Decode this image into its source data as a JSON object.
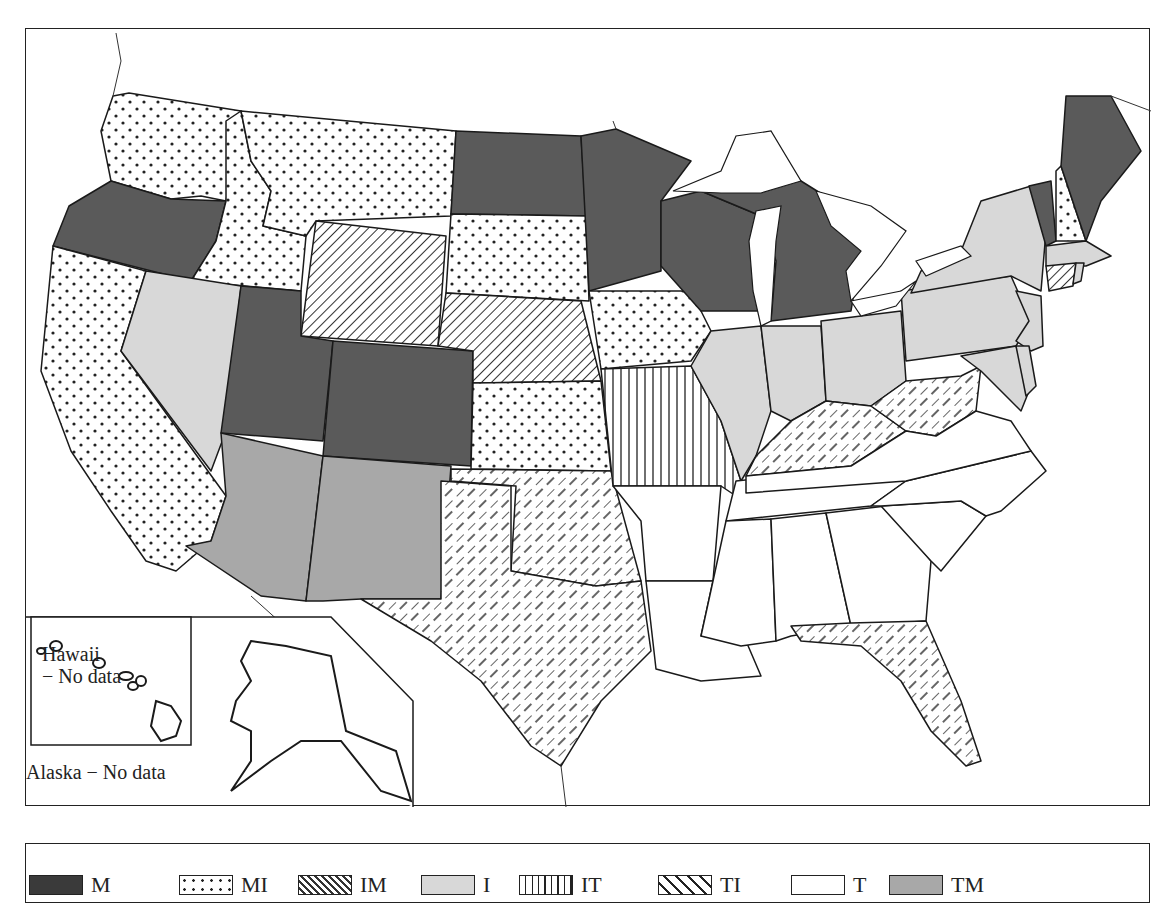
{
  "map": {
    "title": "",
    "insets": {
      "hawaii_label_line1": "Hawaii",
      "hawaii_label_line2": "− No data",
      "alaska_label": "Alaska − No data"
    },
    "categories": {
      "M": {
        "pattern": "solid-dark",
        "color": "#5a5a5a"
      },
      "MI": {
        "pattern": "dots",
        "color": "#ffffff"
      },
      "IM": {
        "pattern": "diagonal-dense",
        "color": "#ffffff"
      },
      "I": {
        "pattern": "solid-light",
        "color": "#d8d8d8"
      },
      "IT": {
        "pattern": "vertical-lines",
        "color": "#ffffff"
      },
      "TI": {
        "pattern": "diagonal-dashed",
        "color": "#ffffff"
      },
      "T": {
        "pattern": "blank",
        "color": "#ffffff"
      },
      "TM": {
        "pattern": "solid-medium",
        "color": "#a8a8a8"
      }
    },
    "states": {
      "Washington": "MI",
      "Oregon": "M",
      "California": "MI",
      "Idaho": "MI",
      "Nevada": "I",
      "Montana": "MI",
      "Wyoming": "IM",
      "Utah": "M",
      "Colorado": "M",
      "Arizona": "TM",
      "New Mexico": "TM",
      "North Dakota": "M",
      "South Dakota": "MI",
      "Nebraska": "IM",
      "Kansas": "MI",
      "Oklahoma": "TI",
      "Texas": "TI",
      "Minnesota": "M",
      "Iowa": "MI",
      "Missouri": "IT",
      "Arkansas": "T",
      "Louisiana": "T",
      "Wisconsin": "M",
      "Michigan": "M",
      "Illinois": "I",
      "Indiana": "I",
      "Ohio": "I",
      "Kentucky": "TI",
      "Tennessee": "T",
      "Mississippi": "T",
      "Alabama": "T",
      "Georgia": "T",
      "Florida": "TI",
      "South Carolina": "T",
      "North Carolina": "T",
      "Virginia": "T",
      "West Virginia": "TI",
      "Maryland": "I",
      "Delaware": "I",
      "Pennsylvania": "I",
      "New Jersey": "I",
      "New York": "I",
      "Connecticut": "IM",
      "Rhode Island": "I",
      "Massachusetts": "I",
      "Vermont": "M",
      "New Hampshire": "MI",
      "Maine": "M",
      "Alaska": "No data",
      "Hawaii": "No data"
    }
  },
  "legend": {
    "items": [
      {
        "label": "M",
        "pattern": "solid-dark"
      },
      {
        "label": "MI",
        "pattern": "dots"
      },
      {
        "label": "IM",
        "pattern": "diagonal-dense"
      },
      {
        "label": "I",
        "pattern": "solid-light"
      },
      {
        "label": "IT",
        "pattern": "vertical-lines"
      },
      {
        "label": "TI",
        "pattern": "diagonal-dashed"
      },
      {
        "label": "T",
        "pattern": "blank"
      },
      {
        "label": "TM",
        "pattern": "solid-medium"
      }
    ]
  }
}
